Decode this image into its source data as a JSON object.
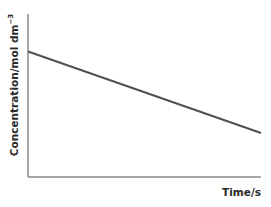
{
  "chart_data": {
    "type": "line",
    "title": "",
    "xlabel": "Time/s",
    "ylabel": "Concentration/mol dm",
    "ylabel_superscript": "−3",
    "x": [
      0,
      1
    ],
    "series": [
      {
        "name": "concentration",
        "values": [
          0.77,
          0.27
        ]
      }
    ],
    "xlim": [
      0,
      1
    ],
    "ylim": [
      0,
      1
    ],
    "xticks": [],
    "yticks": [],
    "grid": false,
    "legend": null,
    "note": "Qualitative graph, no numeric scale; straight line decreasing linearly (zero-order kinetics)."
  },
  "colors": {
    "axis": "#8a8a8a",
    "line": "#505050",
    "text": "#2a2a2a"
  }
}
